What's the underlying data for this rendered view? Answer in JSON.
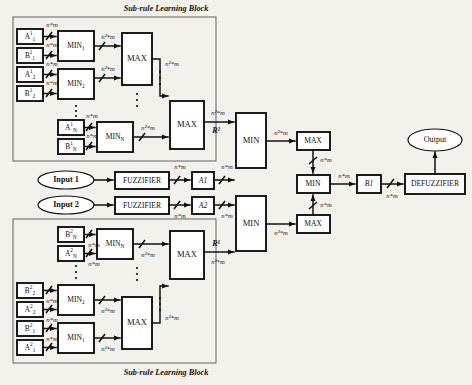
{
  "diagram": {
    "captions": {
      "top_block": "Sub-rule Learning Block",
      "bottom_block": "Sub-rule Learning Block"
    },
    "colors": {
      "background": "#f2f1ec",
      "box_fill": "#ffffff",
      "stroke": "#111111",
      "container_stroke": "#6d6d6d"
    },
    "signal_labels": {
      "nm": "n*m",
      "n2m": "n²*m"
    },
    "rule_labels": {
      "top": "R²",
      "bottom": "R¹"
    },
    "top_block": {
      "terminals": [
        {
          "name": "A",
          "sup": "1",
          "sub": "1"
        },
        {
          "name": "B",
          "sup": "1",
          "sub": "1"
        },
        {
          "name": "A",
          "sup": "1",
          "sub": "2"
        },
        {
          "name": "B",
          "sup": "1",
          "sub": "2"
        },
        {
          "name": "A",
          "sup": "1",
          "sub": "N"
        },
        {
          "name": "B",
          "sup": "1",
          "sub": "N"
        }
      ],
      "min_units": [
        {
          "label": "MIN",
          "sub": "1"
        },
        {
          "label": "MIN",
          "sub": "2"
        },
        {
          "label": "MIN",
          "sub": "N"
        }
      ],
      "max_units": [
        "MAX",
        "MAX"
      ]
    },
    "bottom_block": {
      "terminals": [
        {
          "name": "B",
          "sup": "2",
          "sub": "N"
        },
        {
          "name": "A",
          "sup": "2",
          "sub": "N"
        },
        {
          "name": "B",
          "sup": "2",
          "sub": "2"
        },
        {
          "name": "A",
          "sup": "2",
          "sub": "2"
        },
        {
          "name": "B",
          "sup": "2",
          "sub": "1"
        },
        {
          "name": "A",
          "sup": "2",
          "sub": "1"
        }
      ],
      "min_units": [
        {
          "label": "MIN",
          "sub": "N"
        },
        {
          "label": "MIN",
          "sub": "2"
        },
        {
          "label": "MIN",
          "sub": "1"
        }
      ],
      "max_units": [
        "MAX",
        "MAX"
      ]
    },
    "inputs": [
      {
        "label": "Input 1",
        "fuzzifier": "FUZZIFIER",
        "set": "A1"
      },
      {
        "label": "Input 2",
        "fuzzifier": "FUZZIFIER",
        "set": "A2"
      }
    ],
    "aggregation": {
      "min_top": "MIN",
      "min_bottom": "MIN",
      "max_top": "MAX",
      "max_bottom": "MAX",
      "min_center": "MIN"
    },
    "output_chain": {
      "b1": "B1",
      "defuzzifier": "DEFUZZIFIER",
      "output": "Output"
    }
  }
}
